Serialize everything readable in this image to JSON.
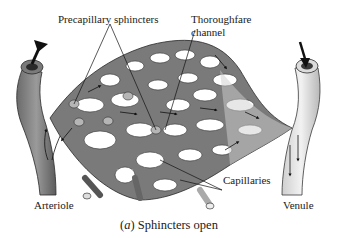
{
  "figure": {
    "caption_prefix": "(",
    "caption_letter": "a",
    "caption_text": ") Sphincters open",
    "labels": {
      "precapillary": "Precapillary sphincters",
      "thoroughfare_line1": "Thoroughfare",
      "thoroughfare_line2": "channel",
      "capillaries": "Capillaries",
      "arteriole": "Arteriole",
      "venule": "Venule"
    },
    "colors": {
      "vessel_dark": "#5a5a5a",
      "vessel_light": "#bdbdbd",
      "outline": "#2a2a2a",
      "background": "#ffffff"
    }
  }
}
